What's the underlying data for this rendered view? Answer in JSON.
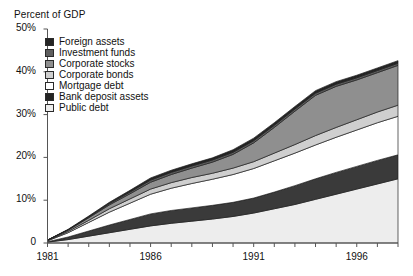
{
  "chart_data": {
    "type": "area",
    "stacked": true,
    "title": "Percent of GDP",
    "xlabel": "",
    "ylabel": "Percent of GDP",
    "ylim": [
      0,
      50
    ],
    "xlim": [
      1981,
      1998
    ],
    "grid": false,
    "legend_position": "upper-left-inside",
    "ytick_labels": [
      "50%",
      "40%",
      "30%",
      "20%",
      "10%",
      "0"
    ],
    "ytick_values": [
      50,
      40,
      30,
      20,
      10,
      0
    ],
    "xtick_labels": [
      "1981",
      "1986",
      "1991",
      "1996"
    ],
    "xtick_values": [
      1981,
      1986,
      1991,
      1996
    ],
    "x": [
      1981,
      1982,
      1983,
      1984,
      1985,
      1986,
      1987,
      1988,
      1989,
      1990,
      1991,
      1992,
      1993,
      1994,
      1995,
      1996,
      1997,
      1998
    ],
    "stack_order_bottom_to_top": [
      "Public debt",
      "Bank deposit assets",
      "Mortgage debt",
      "Corporate bonds",
      "Corporate stocks",
      "Investment funds",
      "Foreign assets"
    ],
    "series": [
      {
        "name": "Public debt",
        "color": "#ededed",
        "values": [
          0.2,
          0.8,
          1.6,
          2.4,
          3.2,
          4.0,
          4.6,
          5.1,
          5.6,
          6.2,
          7.0,
          8.0,
          9.0,
          10.2,
          11.4,
          12.6,
          13.8,
          15.0
        ]
      },
      {
        "name": "Bank deposit assets",
        "color": "#3a3a3a",
        "values": [
          0.1,
          0.6,
          1.2,
          1.8,
          2.3,
          2.8,
          3.0,
          3.1,
          3.2,
          3.3,
          3.5,
          3.9,
          4.4,
          4.8,
          5.1,
          5.3,
          5.5,
          5.6
        ]
      },
      {
        "name": "Mortgage debt",
        "color": "#ffffff",
        "values": [
          0.2,
          1.0,
          2.0,
          3.0,
          3.8,
          4.6,
          5.2,
          5.7,
          6.1,
          6.5,
          6.9,
          7.3,
          7.6,
          7.9,
          8.2,
          8.5,
          8.8,
          9.0
        ]
      },
      {
        "name": "Corporate bonds",
        "color": "#cfcfcf",
        "values": [
          0.1,
          0.3,
          0.5,
          0.8,
          1.0,
          1.2,
          1.3,
          1.4,
          1.4,
          1.5,
          1.6,
          1.8,
          2.0,
          2.2,
          2.3,
          2.4,
          2.5,
          2.6
        ]
      },
      {
        "name": "Corporate stocks",
        "color": "#8f8f8f",
        "values": [
          0.1,
          0.3,
          0.6,
          0.9,
          1.2,
          1.6,
          1.9,
          2.2,
          2.6,
          3.2,
          4.4,
          6.0,
          7.8,
          9.4,
          9.6,
          9.3,
          9.2,
          9.3
        ]
      },
      {
        "name": "Investment funds",
        "color": "#5e5e5e",
        "values": [
          0.0,
          0.1,
          0.2,
          0.3,
          0.4,
          0.5,
          0.5,
          0.5,
          0.5,
          0.5,
          0.5,
          0.5,
          0.5,
          0.5,
          0.5,
          0.5,
          0.5,
          0.5
        ]
      },
      {
        "name": "Foreign assets",
        "color": "#242424",
        "values": [
          0.0,
          0.1,
          0.2,
          0.3,
          0.4,
          0.5,
          0.5,
          0.5,
          0.5,
          0.6,
          0.6,
          0.6,
          0.6,
          0.6,
          0.6,
          0.6,
          0.6,
          0.6
        ]
      }
    ],
    "totals": [
      0.7,
      3.2,
      6.3,
      9.5,
      12.3,
      15.2,
      17.0,
      18.5,
      19.9,
      21.8,
      24.5,
      28.1,
      31.9,
      35.6,
      37.7,
      39.2,
      40.9,
      42.6
    ]
  },
  "legend": {
    "items": [
      {
        "label": "Foreign assets",
        "color": "#242424"
      },
      {
        "label": "Investment funds",
        "color": "#5e5e5e"
      },
      {
        "label": "Corporate stocks",
        "color": "#8f8f8f"
      },
      {
        "label": "Corporate bonds",
        "color": "#cfcfcf"
      },
      {
        "label": "Mortgage debt",
        "color": "#ffffff"
      },
      {
        "label": "Bank deposit assets",
        "color": "#242424"
      },
      {
        "label": "Public debt",
        "color": "#ededed"
      }
    ]
  },
  "axis": {
    "title": "Percent of GDP"
  }
}
